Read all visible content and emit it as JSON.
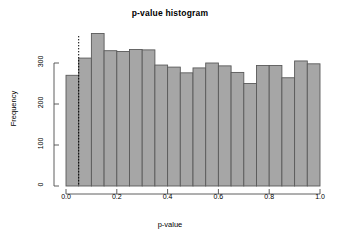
{
  "figure": {
    "title": "p-value histogram",
    "background_color": "#ffffff"
  },
  "axes": {
    "x_label": "p-value",
    "y_label": "Frequency",
    "x_ticks": [
      "0.0",
      "0.2",
      "0.4",
      "0.6",
      "0.8",
      "1.0"
    ],
    "y_ticks": [
      "0",
      "100",
      "200",
      "300"
    ]
  },
  "annotation": {
    "threshold_label": "0.05",
    "threshold_style": "dotted-vertical-line"
  },
  "colors": {
    "bar_fill": "#a6a6a6",
    "bar_border": "#5a5a5a",
    "axis": "#4d4d4d",
    "text": "#000000"
  },
  "chart_data": {
    "type": "bar",
    "title": "p-value histogram",
    "xlabel": "p-value",
    "ylabel": "Frequency",
    "xlim": [
      0.0,
      1.0
    ],
    "ylim": [
      0,
      380
    ],
    "grid": false,
    "legend": null,
    "bin_width": 0.05,
    "bin_edges": [
      0.0,
      0.05,
      0.1,
      0.15,
      0.2,
      0.25,
      0.3,
      0.35,
      0.4,
      0.45,
      0.5,
      0.55,
      0.6,
      0.65,
      0.7,
      0.75,
      0.8,
      0.85,
      0.9,
      0.95,
      1.0
    ],
    "categories": [
      "0.00-0.05",
      "0.05-0.10",
      "0.10-0.15",
      "0.15-0.20",
      "0.20-0.25",
      "0.25-0.30",
      "0.30-0.35",
      "0.35-0.40",
      "0.40-0.45",
      "0.45-0.50",
      "0.50-0.55",
      "0.55-0.60",
      "0.60-0.65",
      "0.65-0.70",
      "0.70-0.75",
      "0.75-0.80",
      "0.80-0.85",
      "0.85-0.90",
      "0.90-0.95",
      "0.95-1.00"
    ],
    "values": [
      270,
      312,
      372,
      330,
      328,
      333,
      332,
      295,
      290,
      276,
      288,
      300,
      293,
      277,
      250,
      294,
      294,
      264,
      305,
      298
    ],
    "annotations": [
      {
        "type": "vline",
        "x": 0.05,
        "style": "dotted",
        "color": "#000000"
      }
    ]
  }
}
